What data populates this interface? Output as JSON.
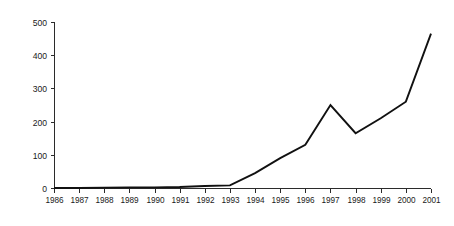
{
  "chart_data": {
    "type": "line",
    "title": "",
    "subtitle": "",
    "xlabel": "",
    "ylabel": "",
    "categories": [
      "1986",
      "1987",
      "1988",
      "1989",
      "1990",
      "1991",
      "1992",
      "1993",
      "1994",
      "1995",
      "1996",
      "1997",
      "1998",
      "1999",
      "2000",
      "2001"
    ],
    "values": [
      0,
      0,
      1,
      2,
      2,
      3,
      6,
      8,
      45,
      90,
      130,
      250,
      165,
      210,
      260,
      465
    ],
    "series": [
      {
        "name": "series-1",
        "values": [
          0,
          0,
          1,
          2,
          2,
          3,
          6,
          8,
          45,
          90,
          130,
          250,
          165,
          210,
          260,
          465
        ],
        "color": "#111111"
      }
    ],
    "ylim": [
      0,
      500
    ],
    "yticks": [
      0,
      100,
      200,
      300,
      400,
      500
    ],
    "ytick_labels": [
      "0",
      "100",
      "200",
      "300",
      "400",
      "500"
    ],
    "xtick_labels": [
      "1986",
      "1987",
      "1988",
      "1989",
      "1990",
      "1991",
      "1992",
      "1993",
      "1994",
      "1995",
      "1996",
      "1997",
      "1998",
      "1999",
      "2000",
      "2001"
    ],
    "grid": false,
    "legend": false,
    "legend_position": "none",
    "line_color": "#111111",
    "axis_color": "#2b2b2b",
    "background_color": "#ffffff"
  },
  "layout": {
    "plot_left": 54,
    "plot_right": 431,
    "plot_top": 22,
    "plot_bottom": 188,
    "tick_length": 4,
    "xlabel_y": 203
  }
}
